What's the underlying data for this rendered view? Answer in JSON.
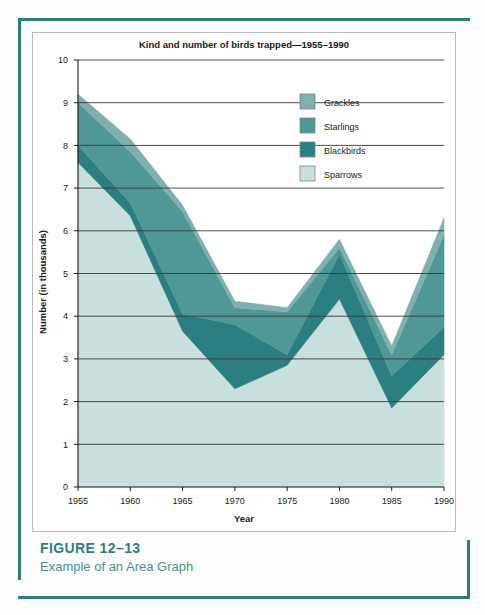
{
  "figure": {
    "caption_title": "FIGURE 12–13",
    "caption_subtitle": "Example of an Area Graph"
  },
  "colors": {
    "frame": "#2e7d7b",
    "caption_title": "#2e7d7b",
    "caption_sub": "#4a8f8d",
    "grackles": "#7fb0ae",
    "starlings": "#4f9896",
    "blackbirds": "#2c7f80",
    "sparrows": "#c7dfdd",
    "gridline": "#3a3a3a",
    "axis": "#1a1a1a",
    "panel_border": "#b9b9b9"
  },
  "chart_data": {
    "type": "area",
    "stacked": true,
    "title": "Kind and number of birds trapped—1955–1990",
    "xlabel": "Year",
    "ylabel": "Number (in thousands)",
    "grid": true,
    "legend_position": "top-right",
    "x": [
      1955,
      1960,
      1965,
      1970,
      1975,
      1980,
      1985,
      1990
    ],
    "xticklabels": [
      "1955",
      "1960",
      "1965",
      "1970",
      "1975",
      "1980",
      "1985",
      "1990"
    ],
    "yticklabels": [
      "0",
      "1",
      "2",
      "3",
      "4",
      "5",
      "6",
      "7",
      "8",
      "9",
      "10"
    ],
    "ylim": [
      0,
      10
    ],
    "xlim": [
      1955,
      1990
    ],
    "series": [
      {
        "name": "Sparrows",
        "color": "#c7dfdd",
        "values": [
          7.6,
          6.35,
          3.65,
          2.3,
          2.85,
          4.4,
          1.85,
          3.1
        ]
      },
      {
        "name": "Blackbirds",
        "color": "#2c7f80",
        "values": [
          0.4,
          0.3,
          0.4,
          1.5,
          0.25,
          1.05,
          0.75,
          0.65
        ]
      },
      {
        "name": "Starlings",
        "color": "#4f9896",
        "values": [
          1.0,
          1.2,
          2.4,
          0.4,
          1.0,
          0.15,
          0.5,
          2.15
        ]
      },
      {
        "name": "Grackles",
        "color": "#7fb0ae",
        "values": [
          0.2,
          0.3,
          0.15,
          0.15,
          0.1,
          0.2,
          0.2,
          0.4
        ]
      }
    ],
    "cumulative_tops": {
      "Sparrows": [
        7.6,
        6.35,
        3.65,
        2.3,
        2.85,
        4.4,
        1.85,
        3.1
      ],
      "Blackbirds": [
        8.0,
        6.65,
        4.05,
        3.8,
        3.1,
        5.45,
        2.6,
        3.75
      ],
      "Starlings": [
        9.0,
        7.85,
        6.45,
        4.2,
        4.1,
        5.6,
        3.1,
        5.9
      ],
      "Grackles": [
        9.2,
        8.15,
        6.6,
        4.35,
        4.2,
        5.8,
        3.3,
        6.3
      ]
    },
    "legend": [
      {
        "label": "Grackles",
        "color": "#7fb0ae"
      },
      {
        "label": "Starlings",
        "color": "#4f9896"
      },
      {
        "label": "Blackbirds",
        "color": "#2c7f80"
      },
      {
        "label": "Sparrows",
        "color": "#c7dfdd"
      }
    ]
  }
}
